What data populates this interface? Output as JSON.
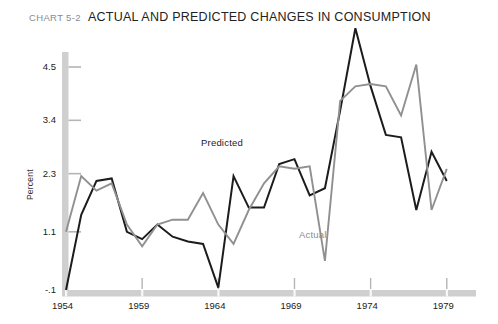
{
  "header": {
    "chart_number": "CHART 5-2",
    "title": "ACTUAL AND PREDICTED CHANGES IN CONSUMPTION"
  },
  "labels": {
    "predicted": "Predicted",
    "actual": "Actual",
    "y_axis_title": "Percent"
  },
  "colors": {
    "predicted_line": "#1c1c1c",
    "actual_line": "#909090",
    "axis_bar": "#cfcfcf",
    "tick": "#b5b5b5",
    "title_number": "#8a8a8a",
    "background": "#ffffff"
  },
  "chart_data": {
    "type": "line",
    "title": "ACTUAL AND PREDICTED CHANGES IN CONSUMPTION",
    "subtitle": "CHART 5-2",
    "xlabel": "",
    "ylabel": "Percent",
    "grid": false,
    "legend": "inline-annotations",
    "xlim": [
      1954,
      1980
    ],
    "ylim": [
      -0.1,
      5.6
    ],
    "ytick_labels": [
      "4.5",
      "3.4",
      "2.3",
      "1.1",
      "-.1"
    ],
    "ytick_values": [
      4.5,
      3.4,
      2.3,
      1.1,
      -0.1
    ],
    "xtick_labels": [
      "1954",
      "1959",
      "1964",
      "1969",
      "1974",
      "1979"
    ],
    "xtick_values": [
      1954,
      1959,
      1964,
      1969,
      1974,
      1979
    ],
    "x": [
      1954,
      1955,
      1956,
      1957,
      1958,
      1959,
      1960,
      1961,
      1962,
      1963,
      1964,
      1965,
      1966,
      1967,
      1968,
      1969,
      1970,
      1971,
      1972,
      1973,
      1974,
      1975,
      1976,
      1977,
      1978,
      1979
    ],
    "series": [
      {
        "name": "Predicted",
        "color": "#1c1c1c",
        "values": [
          -0.1,
          1.45,
          2.15,
          2.2,
          1.1,
          0.95,
          1.25,
          1.0,
          0.9,
          0.85,
          -0.05,
          2.25,
          1.6,
          1.6,
          2.5,
          2.6,
          1.85,
          2.0,
          3.6,
          5.3,
          4.1,
          3.1,
          3.05,
          1.55,
          2.75,
          2.15
        ]
      },
      {
        "name": "Actual",
        "color": "#909090",
        "values": [
          1.1,
          2.25,
          1.95,
          2.1,
          1.25,
          0.8,
          1.25,
          1.35,
          1.35,
          1.9,
          1.25,
          0.85,
          1.55,
          2.1,
          2.45,
          2.4,
          2.45,
          0.5,
          3.8,
          4.1,
          4.15,
          4.1,
          3.5,
          4.55,
          1.55,
          2.4
        ]
      }
    ],
    "annotations": [
      {
        "text": "Predicted",
        "x": 1967.2,
        "y": 3.15
      },
      {
        "text": "Actual",
        "x": 1971.5,
        "y": 1.05
      }
    ]
  }
}
